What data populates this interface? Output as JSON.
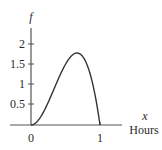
{
  "chart_data": {
    "type": "line",
    "title": "",
    "xlabel": "Hours",
    "xvar": "x",
    "ylabel": "f",
    "xlim": [
      -0.4,
      1.3
    ],
    "ylim": [
      0,
      2.3
    ],
    "x_ticks": [
      0,
      1
    ],
    "x_tick_labels": [
      "0",
      "1"
    ],
    "y_ticks": [
      0.5,
      1,
      1.5,
      2
    ],
    "y_tick_labels": [
      "0.5",
      "1",
      "1.5",
      "2"
    ],
    "grid": false,
    "legend": null,
    "function": "f(x) = 12x^2(1-x)",
    "series": [
      {
        "name": "f",
        "x": [
          0,
          0.1,
          0.2,
          0.3,
          0.4,
          0.5,
          0.6,
          0.667,
          0.7,
          0.8,
          0.9,
          1.0
        ],
        "values": [
          0,
          0.108,
          0.384,
          0.756,
          1.152,
          1.5,
          1.728,
          1.778,
          1.764,
          1.536,
          0.972,
          0
        ]
      }
    ],
    "color": "#333333"
  },
  "labels": {
    "y_axis": "f",
    "x_axis_var": "x",
    "x_axis_unit": "Hours",
    "ytick_2": "2",
    "ytick_15": "1.5",
    "ytick_1": "1",
    "ytick_05": "0.5",
    "xtick_0": "0",
    "xtick_1": "1"
  }
}
